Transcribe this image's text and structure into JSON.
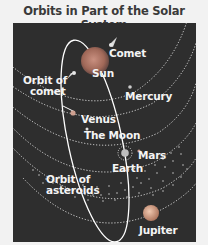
{
  "title": "Orbits in Part of the Solar System",
  "labels": {
    "comet": "Comet",
    "sun": "Sun",
    "orbit_of_comet_line1": "Orbit of",
    "orbit_of_comet_line2": "comet",
    "mercury": "Mercury",
    "venus": "Venus",
    "the_moon": "The Moon",
    "mars": "Mars",
    "earth": "Earth",
    "orbit_of_asteroids_line1": "Orbit of",
    "orbit_of_asteroids_line2": "asteroids",
    "jupiter": "Jupiter"
  },
  "note": "Not to scale",
  "colors": {
    "background": "#2e2e2e",
    "orbit_lines": "#ffffff",
    "sun": "#b07060",
    "jupiter": "#d9a28a",
    "text": "#f4f4f4"
  }
}
